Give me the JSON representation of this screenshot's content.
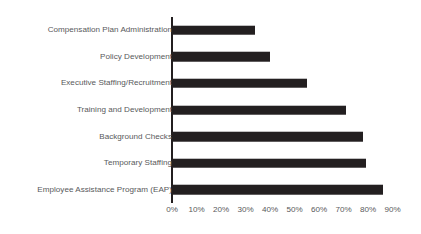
{
  "chart_data": {
    "type": "bar",
    "orientation": "horizontal",
    "title": "",
    "xlabel": "",
    "ylabel": "",
    "categories": [
      "Compensation Plan Administration",
      "Policy Development",
      "Executive Staffing/Recruitment",
      "Training and Development",
      "Background Checks",
      "Temporary Staffing",
      "Employee Assistance Program (EAP)"
    ],
    "values": [
      34,
      40,
      55,
      71,
      78,
      79,
      86
    ],
    "xlim": [
      0,
      90
    ],
    "xticks": [
      0,
      10,
      20,
      30,
      40,
      50,
      60,
      70,
      80,
      90
    ],
    "xtick_labels": [
      "0%",
      "10%",
      "20%",
      "30%",
      "40%",
      "50%",
      "60%",
      "70%",
      "80%",
      "90%"
    ],
    "grid": false,
    "legend": false,
    "bar_color": "#231f20",
    "axis_color": "#231f20",
    "text_color": "#58595b",
    "background_color": "#ffffff"
  }
}
